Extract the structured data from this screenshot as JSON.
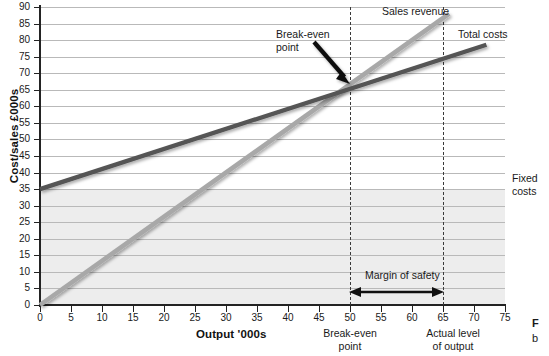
{
  "chart_data": {
    "type": "line",
    "title": "",
    "xlabel": "Output '000s",
    "ylabel": "Cost/sales £000s",
    "xlim": [
      0,
      75
    ],
    "ylim": [
      0,
      90
    ],
    "x_ticks": [
      0,
      5,
      10,
      15,
      20,
      25,
      30,
      35,
      40,
      45,
      50,
      55,
      60,
      65,
      70,
      75
    ],
    "y_ticks": [
      0,
      5,
      10,
      15,
      20,
      25,
      30,
      35,
      40,
      45,
      50,
      55,
      60,
      65,
      70,
      75,
      80,
      85,
      90
    ],
    "grid": "horizontal",
    "legend_position": "inline-labels",
    "series": [
      {
        "name": "Sales revenue",
        "color": "#a8a8a8",
        "points": [
          [
            0,
            0
          ],
          [
            66,
            88
          ]
        ],
        "note": "straight line through origin, slope 1.3 (£1300 per 1000 units)"
      },
      {
        "name": "Total costs",
        "color": "#545454",
        "points": [
          [
            0,
            35
          ],
          [
            72,
            78.6
          ]
        ],
        "note": "fixed costs 35 plus variable costs, slope 0.6"
      },
      {
        "name": "Fixed costs",
        "color": "#545454",
        "points": [
          [
            0,
            35
          ],
          [
            75,
            35
          ]
        ],
        "note": "horizontal line at 35"
      }
    ],
    "annotations": [
      {
        "name": "break-even-point",
        "label": "Break-even\npoint",
        "x": 50,
        "y": 65,
        "arrow": true
      },
      {
        "name": "margin-of-safety",
        "label": "Margin of safety",
        "from_x": 50,
        "to_x": 65,
        "arrow": "double"
      },
      {
        "name": "break-even-axis-note",
        "label": "Break-even\npoint",
        "x": 50
      },
      {
        "name": "actual-output-axis-note",
        "label": "Actual level\nof output",
        "x": 65
      }
    ],
    "shaded_region": {
      "name": "fixed-costs-area",
      "from_y": 0,
      "to_y": 35,
      "color": "#ededed"
    },
    "dashed_verticals": [
      50,
      65
    ]
  },
  "axis": {
    "y_title": "Cost/sales £000s",
    "x_title": "Output '000s",
    "y_ticks": [
      "0",
      "5",
      "10",
      "15",
      "20",
      "25",
      "30",
      "35",
      "40",
      "45",
      "50",
      "55",
      "60",
      "65",
      "70",
      "75",
      "80",
      "85",
      "90"
    ],
    "x_ticks": [
      "0",
      "5",
      "10",
      "15",
      "20",
      "25",
      "30",
      "35",
      "40",
      "45",
      "50",
      "55",
      "60",
      "65",
      "70",
      "75"
    ]
  },
  "labels": {
    "break_even_line1": "Break-even",
    "break_even_line2": "point",
    "sales_revenue": "Sales revenue",
    "total_costs": "Total costs",
    "fixed_costs_line1": "Fixed",
    "fixed_costs_line2": "costs",
    "margin_of_safety": "Margin of safety",
    "axis_note_be_line1": "Break-even",
    "axis_note_be_line2": "point",
    "axis_note_actual_line1": "Actual level",
    "axis_note_actual_line2": "of output"
  },
  "page_edge": {
    "cut_line1": "F",
    "cut_line2": "b"
  },
  "colors": {
    "sales_revenue": "#a8a8a8",
    "total_costs": "#545454",
    "fixed_costs": "#545454",
    "shade": "#ededed",
    "grid": "#b9b9b9",
    "axis": "#232323",
    "text": "#1a1a1a"
  }
}
